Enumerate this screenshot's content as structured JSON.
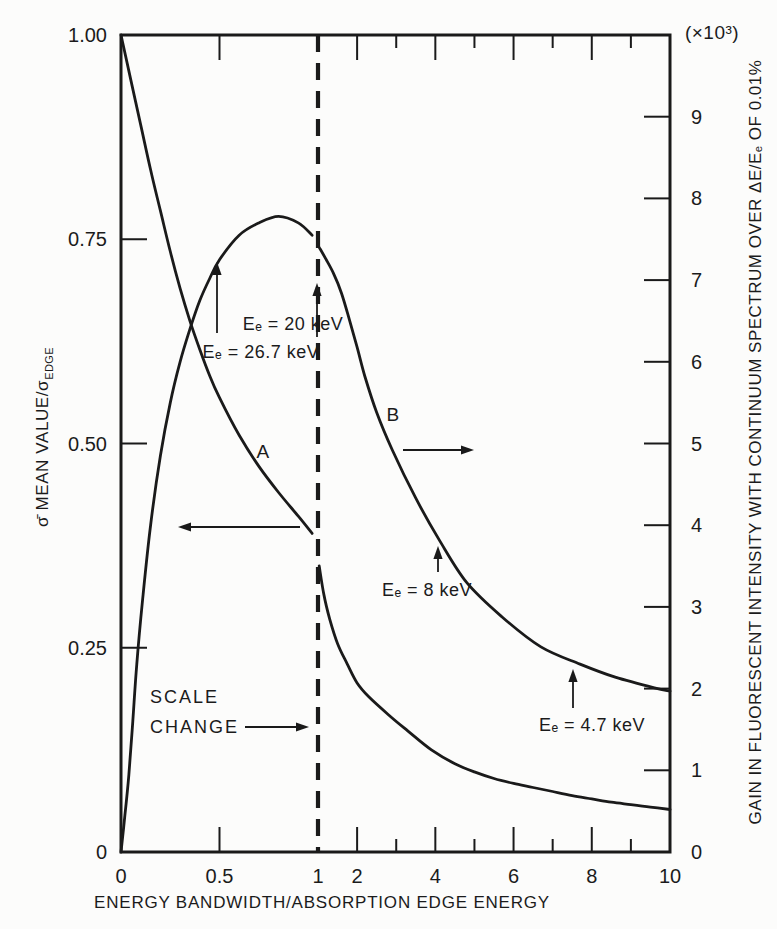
{
  "figure": {
    "background": "#fcfcfb",
    "ink_color": "#1a1a1a"
  },
  "chart_data": {
    "type": "line",
    "title": "",
    "xlabel": "ENERGY BANDWIDTH/ABSORPTION EDGE ENERGY",
    "ylabel_left_main": "σ̄ MEAN VALUE/σ",
    "ylabel_left_sub": "EDGE",
    "ylabel_right": "GAIN IN FLUORESCENT INTENSITY WITH CONTINUUM SPECTRUM OVER ΔE/Eₑ OF 0.01%",
    "right_axis_multiplier": "(×10³)",
    "x_axis": {
      "scale_note": "piecewise linear: 0 to 1 on left half, 1 to 10 on right half; scale change at x = 1 (dashed line)",
      "scale_change_x": 1,
      "tick_labels": [
        {
          "v": 0,
          "label": "0"
        },
        {
          "v": 0.5,
          "label": "0.5"
        },
        {
          "v": 1,
          "label": "1"
        },
        {
          "v": 2,
          "label": "2"
        },
        {
          "v": 4,
          "label": "4"
        },
        {
          "v": 6,
          "label": "6"
        },
        {
          "v": 8,
          "label": "8"
        },
        {
          "v": 10,
          "label": "10"
        }
      ],
      "major_ticks": [
        0.5,
        2,
        4,
        6,
        8
      ],
      "minor_ticks": [
        3,
        5,
        7,
        9
      ]
    },
    "y_left": {
      "min": 0,
      "max": 1.0,
      "ticks": [
        0.25,
        0.5,
        0.75
      ],
      "tick_labels": [
        {
          "v": 0,
          "label": "0"
        },
        {
          "v": 0.25,
          "label": "0.25"
        },
        {
          "v": 0.5,
          "label": "0.50"
        },
        {
          "v": 0.75,
          "label": "0.75"
        },
        {
          "v": 1.0,
          "label": "1.00"
        }
      ]
    },
    "y_right": {
      "min": 0,
      "max": 10,
      "ticks": [
        1,
        2,
        3,
        4,
        5,
        6,
        7,
        8,
        9
      ],
      "tick_labels": [
        {
          "v": 0,
          "label": "0"
        },
        {
          "v": 1,
          "label": "1"
        },
        {
          "v": 2,
          "label": "2"
        },
        {
          "v": 3,
          "label": "3"
        },
        {
          "v": 4,
          "label": "4"
        },
        {
          "v": 5,
          "label": "5"
        },
        {
          "v": 6,
          "label": "6"
        },
        {
          "v": 7,
          "label": "7"
        },
        {
          "v": 8,
          "label": "8"
        },
        {
          "v": 9,
          "label": "9"
        }
      ]
    },
    "series": [
      {
        "name": "A",
        "axis": "left",
        "description": "mean cross-section ratio, breaks at scale change",
        "segments": [
          [
            [
              0,
              1.0
            ],
            [
              0.05,
              0.945
            ],
            [
              0.1,
              0.89
            ],
            [
              0.15,
              0.835
            ],
            [
              0.2,
              0.785
            ],
            [
              0.25,
              0.735
            ],
            [
              0.3,
              0.69
            ],
            [
              0.35,
              0.65
            ],
            [
              0.4,
              0.615
            ],
            [
              0.45,
              0.583
            ],
            [
              0.5,
              0.556
            ],
            [
              0.6,
              0.51
            ],
            [
              0.7,
              0.472
            ],
            [
              0.8,
              0.44
            ],
            [
              0.9,
              0.411
            ],
            [
              0.97,
              0.39
            ]
          ],
          [
            [
              1.03,
              0.35
            ],
            [
              1.15,
              0.315
            ],
            [
              1.3,
              0.285
            ],
            [
              1.5,
              0.255
            ],
            [
              1.75,
              0.23
            ],
            [
              2,
              0.207
            ],
            [
              2.3,
              0.19
            ],
            [
              2.8,
              0.168
            ],
            [
              3.3,
              0.148
            ],
            [
              3.9,
              0.125
            ],
            [
              4.5,
              0.108
            ],
            [
              5,
              0.098
            ],
            [
              5.5,
              0.09
            ],
            [
              6,
              0.084
            ],
            [
              6.5,
              0.079
            ],
            [
              7,
              0.074
            ],
            [
              7.5,
              0.069
            ],
            [
              8,
              0.065
            ],
            [
              8.5,
              0.061
            ],
            [
              9,
              0.058
            ],
            [
              9.5,
              0.055
            ],
            [
              10,
              0.052
            ]
          ]
        ]
      },
      {
        "name": "B",
        "axis": "right",
        "description": "gain in fluorescent intensity (×10³), breaks at scale change",
        "segments": [
          [
            [
              0,
              0
            ],
            [
              0.02,
              0.45
            ],
            [
              0.04,
              0.95
            ],
            [
              0.06,
              1.6
            ],
            [
              0.08,
              2.3
            ],
            [
              0.11,
              3.1
            ],
            [
              0.15,
              4.0
            ],
            [
              0.2,
              4.85
            ],
            [
              0.25,
              5.5
            ],
            [
              0.3,
              6.0
            ],
            [
              0.35,
              6.4
            ],
            [
              0.4,
              6.75
            ],
            [
              0.45,
              7.02
            ],
            [
              0.5,
              7.25
            ],
            [
              0.6,
              7.55
            ],
            [
              0.7,
              7.7
            ],
            [
              0.8,
              7.78
            ],
            [
              0.9,
              7.7
            ],
            [
              0.97,
              7.55
            ]
          ],
          [
            [
              1.03,
              7.4
            ],
            [
              1.2,
              7.26
            ],
            [
              1.4,
              7.08
            ],
            [
              1.6,
              6.84
            ],
            [
              1.8,
              6.52
            ],
            [
              2.0,
              6.18
            ],
            [
              2.2,
              5.82
            ],
            [
              2.5,
              5.38
            ],
            [
              2.9,
              4.92
            ],
            [
              3.5,
              4.33
            ],
            [
              4.1,
              3.82
            ],
            [
              4.8,
              3.3
            ],
            [
              5.7,
              2.88
            ],
            [
              6.7,
              2.51
            ],
            [
              7.7,
              2.3
            ],
            [
              8.6,
              2.14
            ],
            [
              9.6,
              2.01
            ],
            [
              10,
              1.97
            ]
          ]
        ]
      }
    ],
    "annotations": {
      "labels": [
        {
          "id": "ee-20kev-label",
          "text": "Eₑ = 20 keV",
          "x": 293,
          "y": 324,
          "align": "center"
        },
        {
          "id": "ee-26-7kev-label",
          "text": "Eₑ = 26.7 keV",
          "x": 261,
          "y": 352,
          "align": "center"
        },
        {
          "id": "curve-a-label",
          "text": "A",
          "x": 263,
          "y": 452,
          "align": "center",
          "cls": "curve-id"
        },
        {
          "id": "curve-b-label",
          "text": "B",
          "x": 393,
          "y": 415,
          "align": "center",
          "cls": "curve-id"
        },
        {
          "id": "scale-change-line1",
          "text": "SCALE",
          "x": 150,
          "y": 697,
          "align": "left",
          "cls": "caps"
        },
        {
          "id": "scale-change-line2",
          "text": "CHANGE",
          "x": 150,
          "y": 727,
          "align": "left",
          "cls": "caps"
        },
        {
          "id": "ee-8kev-label",
          "text": "Eₑ = 8 keV",
          "x": 427,
          "y": 590,
          "align": "center"
        },
        {
          "id": "ee-4-7kev-label",
          "text": "Eₑ = 4.7 keV",
          "x": 592,
          "y": 725,
          "align": "center"
        }
      ],
      "arrows": [
        {
          "id": "ee-26-7kev-arrow",
          "x1": 217,
          "y1": 333,
          "x2": 217,
          "y2": 262
        },
        {
          "id": "ee-20kev-arrow",
          "x1": 317,
          "y1": 337,
          "x2": 317,
          "y2": 283
        },
        {
          "id": "curve-a-axis-arrow",
          "x1": 300,
          "y1": 527,
          "x2": 178,
          "y2": 527
        },
        {
          "id": "curve-b-axis-arrow",
          "x1": 403,
          "y1": 450,
          "x2": 474,
          "y2": 450
        },
        {
          "id": "scale-change-arrow",
          "x1": 245,
          "y1": 727,
          "x2": 309,
          "y2": 727
        },
        {
          "id": "ee-8kev-arrow",
          "x1": 438,
          "y1": 572,
          "x2": 438,
          "y2": 546
        },
        {
          "id": "ee-4-7kev-arrow",
          "x1": 573,
          "y1": 708,
          "x2": 573,
          "y2": 669
        }
      ]
    }
  }
}
